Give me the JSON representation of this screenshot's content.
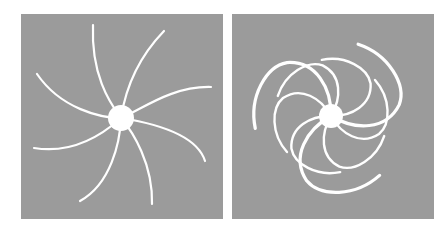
{
  "figure": {
    "panels": [
      {
        "id": "left",
        "description": "Eight thin white curved arms radiating from a central white disc (loosely wound)",
        "arm_count": 8,
        "center_disc": true
      },
      {
        "id": "right",
        "description": "Tightly wound white spiral arms around a central white disc",
        "arm_count": 6,
        "center_disc": true
      }
    ],
    "colors": {
      "background": "#ffffff",
      "panel": "#9b9b9b",
      "foreground": "#ffffff"
    }
  }
}
